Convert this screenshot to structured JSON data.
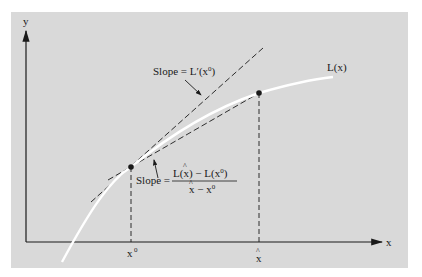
{
  "diagram": {
    "axes": {
      "x_label": "x",
      "y_label": "y"
    },
    "curve": {
      "label": "L(x)",
      "color": "#ffffff"
    },
    "points": [
      {
        "name": "x0-point",
        "tick_label": "x",
        "tick_superscript": "0"
      },
      {
        "name": "xhat-point",
        "tick_label": "x",
        "tick_hat": "^"
      }
    ],
    "tangent_line": {
      "label_prefix": "Slope = L",
      "label_prime": "′",
      "label_arg": "(x",
      "label_sup": "0",
      "label_close": ")"
    },
    "secant_line": {
      "label_prefix": "Slope =",
      "numerator_a": "L(",
      "numerator_a_var": "x",
      "numerator_a_close": ") − L(x",
      "numerator_sup": "0",
      "numerator_close": ")",
      "denominator_var": "x",
      "denominator_mid": " − x",
      "denominator_sup": "0",
      "hat": "^"
    },
    "colors": {
      "panel": "#d9d9d9",
      "ink": "#1a1a1a",
      "curve": "#ffffff"
    }
  }
}
